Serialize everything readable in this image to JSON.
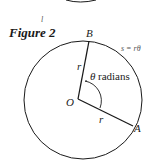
{
  "figure": {
    "title": "Figure 2",
    "stray_mark": "l",
    "points": {
      "center": "O",
      "point_a": "A",
      "point_b": "B"
    },
    "radius_labels": [
      "r",
      "r"
    ],
    "angle_label_symbol": "θ",
    "angle_label_text": "radians",
    "arc_formula": "s = rθ",
    "colors": {
      "stroke": "#1a1a1a",
      "background": "#ffffff"
    }
  }
}
